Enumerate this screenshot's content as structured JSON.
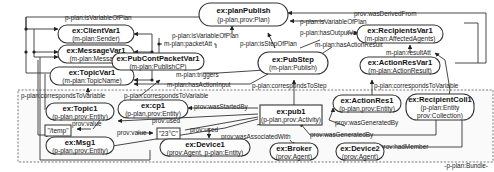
{
  "diagram": {
    "type": "p-plan provenance graph",
    "bundle_label": "-p-plan:Bundle-",
    "nodes": {
      "planPublish": {
        "title": "ex:planPublish",
        "sub": "(p-plan,prov:Plan)"
      },
      "clientVar1": {
        "title": "ex:ClientVar1",
        "sub": "(m-plan:Sender)"
      },
      "messageVar1": {
        "title": "ex:MessageVar1",
        "sub": "(m-plan:Message)"
      },
      "topicVar1": {
        "title": "ex:TopicVar1",
        "sub": "(m-plan:TopicName)"
      },
      "pubContPacketVar1": {
        "title": "ex:PubContPacketVar1",
        "sub": "(m-plan:PublishCP)"
      },
      "pubStep": {
        "title": "ex:PubStep",
        "sub": "(m-plan:Publish)"
      },
      "recipientsVar1": {
        "title": "ex:RecipientsVar1",
        "sub": "(m-plan:AffectedAgents)"
      },
      "actionResVar1": {
        "title": "ex:ActionResVar1",
        "sub": "(m-plan:ActionResult)"
      },
      "topic1": {
        "title": "ex:Topic1",
        "sub": "(p-plan,prov:Entity)"
      },
      "cp1": {
        "title": "ex:cp1",
        "sub": "(p-plan,prov:Entity)"
      },
      "msg1": {
        "title": "ex:Msg1",
        "sub": "(p-plan,prov:Entity)"
      },
      "pub1": {
        "title": "ex:pub1",
        "sub": "(p-plan,prov:Activity)"
      },
      "actionRes1": {
        "title": "ex:ActionRes1",
        "sub": "(p-plan,prov:Entity)"
      },
      "recipientColl1": {
        "title": "ex:RecipientColl1",
        "sub1": "(p-plan:Entity",
        "sub2": "prov:Collection)"
      },
      "device1": {
        "title": "ex:Device1",
        "sub": "(prov:Agent, p-plan:Entity)"
      },
      "broker": {
        "title": "ex:Broker",
        "sub": "(prov:Agent)"
      },
      "device2": {
        "title": "ex:Device2",
        "sub": "(prov:Agent)"
      }
    },
    "literals": {
      "temp": "\"/temp\"",
      "celsius": "\"23°C\""
    },
    "edges": {
      "isVariableOfPlanTop": "p-plan:isVariableOfPlan",
      "isVariableOfPlanRight": "p-plan:isVariableOfPlan",
      "isVariableOfPlanMid": "p-plan:isVariableOfPlan",
      "wasDerivedFrom": "prov:wasDerivedFrom",
      "packetAtt": "m-plan:packetAtt",
      "isStepOfPlan": "p-plan:isStepOfPlan",
      "hasOutputVar": "p-plan:hasOutputVar",
      "hasActionResult": "m-plan:hasActionResult",
      "resultAtt": "m-plan:resultAtt",
      "triggers": "m-plan:triggers",
      "hasActionInput": "m-plan:hasActionInput",
      "correspondsToStep": "p-plan:correspondsToStep",
      "correspondsToVariableRight": "p-plan:correspondsToVariable",
      "correspondsToVariableLeft": "p-plan:correspondsToVariable",
      "correspondsToVariableCp": "p-plan:correspondsToVariable",
      "wasStartedBy": "prov:wasStartedBy",
      "usedTop": "prov:used",
      "usedBottom": "prov:used",
      "valueTemp": "prov:value",
      "valueCelsius": "prov:value",
      "wasAssociatedWith": "prov:wasAssociatedWith",
      "wasGeneratedByA": "prov:wasGeneratedBy",
      "wasGeneratedByB": "prov:wasGeneratedBy",
      "hadMember": "prov:hadMember"
    }
  }
}
